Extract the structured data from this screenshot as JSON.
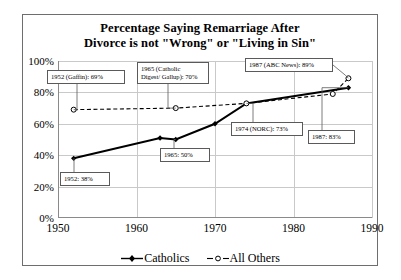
{
  "chart_data": {
    "type": "line",
    "title": "Percentage Saying Remarriage After Divorce is not \"Wrong\" or \"Living in Sin\"",
    "title_line1": "Percentage Saying Remarriage After",
    "title_line2": "Divorce is not \"Wrong\" or \"Living in Sin\"",
    "xlabel": "",
    "ylabel": "",
    "xlim": [
      1950,
      1990
    ],
    "ylim": [
      0,
      100
    ],
    "grid": true,
    "legend_position": "bottom",
    "xticks": [
      "1950",
      "1960",
      "1970",
      "1980",
      "1990"
    ],
    "xtick_values": [
      1950,
      1960,
      1970,
      1980,
      1990
    ],
    "yticks": [
      "0%",
      "20%",
      "40%",
      "60%",
      "80%",
      "100%"
    ],
    "ytick_values": [
      0,
      20,
      40,
      60,
      80,
      100
    ],
    "series": [
      {
        "name": "Catholics",
        "style": "solid",
        "marker": "filled-diamond",
        "color": "#000000",
        "x": [
          1952,
          1963,
          1965,
          1970,
          1974,
          1987
        ],
        "values": [
          38,
          51,
          50,
          60,
          73,
          83
        ]
      },
      {
        "name": "All Others",
        "style": "dashed",
        "marker": "open-circle",
        "color": "#000000",
        "x": [
          1952,
          1965,
          1974,
          1985,
          1987
        ],
        "values": [
          69,
          70,
          73,
          79,
          89
        ]
      }
    ],
    "annotations": [
      {
        "id": "a1952-others",
        "text": "1952 (Gaffin): 69%",
        "x": 1952,
        "y": 69
      },
      {
        "id": "a1965-others",
        "text": "1965 (Catholic\nDigest/ Gallup): 70%",
        "x": 1965,
        "y": 70
      },
      {
        "id": "a1987-others",
        "text": "1987 (ABC News): 89%",
        "x": 1987,
        "y": 89
      },
      {
        "id": "a1952-cath",
        "text": "1952: 38%",
        "x": 1952,
        "y": 38
      },
      {
        "id": "a1965-cath",
        "text": "1965: 50%",
        "x": 1965,
        "y": 50
      },
      {
        "id": "a1974-cath",
        "text": "1974 (NORC): 73%",
        "x": 1974,
        "y": 73
      },
      {
        "id": "a1987-cath",
        "text": "1987: 83%",
        "x": 1987,
        "y": 83
      }
    ],
    "legend": [
      {
        "label": "Catholics",
        "marker": "filled-diamond",
        "style": "solid"
      },
      {
        "label": "All Others",
        "marker": "open-circle",
        "style": "dashed"
      }
    ]
  }
}
